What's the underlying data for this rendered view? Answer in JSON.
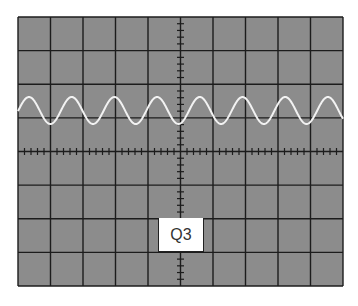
{
  "screen": {
    "left": 18,
    "top": 17,
    "right": 343,
    "bottom": 286,
    "columns": 10,
    "rows": 8,
    "background_color": "#8c8c8c",
    "grid_color": "#1c1c1c",
    "minor_ticks_per_division": 5
  },
  "trace": {
    "color": "#f2f2f2",
    "center_y": 110.5,
    "amplitude": 13.5,
    "period_px": 42.7,
    "first_peak_x": 29,
    "line_width": 2
  },
  "label": {
    "text": "Q3",
    "x": 158,
    "y": 218,
    "width": 46,
    "height": 34
  }
}
